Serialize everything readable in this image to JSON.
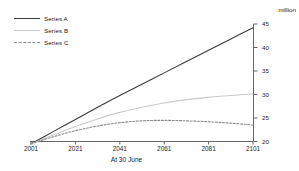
{
  "chart_data": {
    "type": "line",
    "title": "",
    "xlabel": "At 30 June",
    "ylabel": "million",
    "xlim": [
      2001,
      2101
    ],
    "ylim": [
      20,
      45
    ],
    "yticks": [
      20,
      25,
      30,
      35,
      40,
      45
    ],
    "xticks": [
      2001,
      2021,
      2041,
      2061,
      2081,
      2101
    ],
    "grid": false,
    "legend_position": "top-left",
    "x": [
      2001,
      2011,
      2021,
      2031,
      2041,
      2051,
      2061,
      2071,
      2081,
      2091,
      2101
    ],
    "series": [
      {
        "name": "Series A",
        "style": "solid",
        "color": "#3a3a3a",
        "values": [
          19.5,
          22.1,
          24.7,
          27.3,
          29.8,
          32.2,
          34.6,
          37.0,
          39.4,
          41.8,
          44.2
        ]
      },
      {
        "name": "Series B",
        "style": "solid",
        "color": "#c9c9c9",
        "values": [
          19.5,
          21.4,
          23.2,
          24.8,
          26.2,
          27.3,
          28.2,
          28.9,
          29.4,
          29.8,
          30.1
        ]
      },
      {
        "name": "Series C",
        "style": "dashed",
        "color": "#8a8a8a",
        "values": [
          19.5,
          21.0,
          22.3,
          23.3,
          24.0,
          24.4,
          24.5,
          24.4,
          24.2,
          23.9,
          23.5
        ]
      }
    ]
  },
  "axis": {
    "unit_label": "million",
    "x_title": "At 30 June",
    "y_tick_labels": [
      "45",
      "40",
      "35",
      "30",
      "25",
      "20"
    ],
    "x_tick_labels": [
      "2001",
      "2021",
      "2041",
      "2061",
      "2081",
      "2101"
    ]
  },
  "legend": {
    "items": [
      {
        "label": "Series A"
      },
      {
        "label": "Series B"
      },
      {
        "label": "Series C"
      }
    ]
  },
  "colors": {
    "series_a": "#3a3a3a",
    "series_b": "#c9c9c9",
    "series_c": "#8a8a8a",
    "axis": "#555555",
    "text": "#1a1a1a",
    "background": "#ffffff"
  }
}
